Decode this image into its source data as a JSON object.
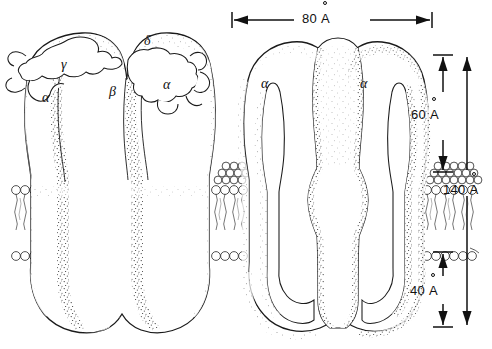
{
  "figure": {
    "stroke_color": "#1a1a1a",
    "fill_color": "#ffffff",
    "stipple_color": "#2b2b2b",
    "background": "#ffffff"
  },
  "dimensions": [
    {
      "id": "width-80",
      "value": "80",
      "unit": "A",
      "text": "80 Å",
      "orientation": "horizontal",
      "label": "80 Å"
    },
    {
      "id": "height-60",
      "value": "60",
      "unit": "A",
      "text": "60 Å",
      "orientation": "vertical",
      "label": "60 Å"
    },
    {
      "id": "height-140",
      "value": "140",
      "unit": "A",
      "text": "140 Å",
      "orientation": "vertical",
      "label": "140 Å"
    },
    {
      "id": "height-40",
      "value": "40",
      "unit": "A",
      "text": "40 Å",
      "orientation": "vertical",
      "label": "40 Å"
    }
  ],
  "dim_numbers": {
    "w80": "80",
    "h60": "60",
    "h140": "140",
    "h40": "40"
  },
  "subunit_labels": [
    {
      "id": "left-alpha-1",
      "text": "α",
      "name": "alpha"
    },
    {
      "id": "left-beta",
      "text": "β",
      "name": "beta"
    },
    {
      "id": "left-gamma",
      "text": "γ",
      "name": "gamma"
    },
    {
      "id": "left-delta",
      "text": "δ",
      "name": "delta"
    },
    {
      "id": "left-alpha-2",
      "text": "α",
      "name": "alpha"
    },
    {
      "id": "right-alpha-1",
      "text": "α",
      "name": "alpha"
    },
    {
      "id": "right-alpha-2",
      "text": "α",
      "name": "alpha"
    }
  ],
  "structures": {
    "left_receptor": "intact pentameric receptor with bound antibody ribbons",
    "right_receptor": "cutaway receptor revealing central ion channel pore",
    "membrane": "phospholipid bilayer with circular head groups and wavy acyl tails"
  }
}
